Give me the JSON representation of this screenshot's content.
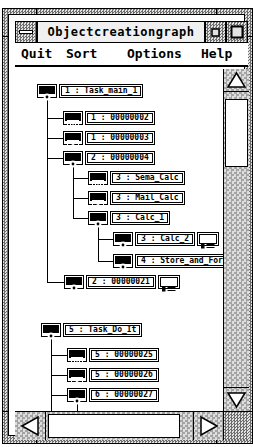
{
  "window": {
    "title": "Objectcreationgraph"
  },
  "menu": {
    "items": [
      {
        "label": "Quit"
      },
      {
        "label": "Sort"
      },
      {
        "label": "Options"
      },
      {
        "label": "Help"
      }
    ]
  },
  "tree1": {
    "nodes": [
      {
        "label": "1 : Task_main_1",
        "icon": "task"
      },
      {
        "label": "1 : 00000002",
        "icon": "semaphore"
      },
      {
        "label": "1 : 00000003",
        "icon": "mail"
      },
      {
        "label": "2 : 00000004",
        "icon": "task"
      },
      {
        "label": "3 : Sema_Calc",
        "icon": "semaphore"
      },
      {
        "label": "3 : Mail_Calc",
        "icon": "mail"
      },
      {
        "label": "3 : Calc_1",
        "icon": "task"
      },
      {
        "label": "3 : Calc_2",
        "icon": "task",
        "has_detail": true
      },
      {
        "label": "4 : Store_and_Forwa",
        "icon": "task"
      },
      {
        "label": "2 : 00000021",
        "icon": "task",
        "has_detail": true
      }
    ]
  },
  "tree2": {
    "nodes": [
      {
        "label": "5 : Task_Do_It",
        "icon": "task"
      },
      {
        "label": "5 : 00000025",
        "icon": "semaphore"
      },
      {
        "label": "5 : 00000026",
        "icon": "mail"
      },
      {
        "label": "6 : 00000027",
        "icon": "task"
      }
    ]
  },
  "icons": {
    "window_menu": "horizontal-bar",
    "minimize": "small-square",
    "maximize": "large-square",
    "task": "filled-circle",
    "semaphore": "barred-window",
    "mail": "envelope",
    "detail": "list-box",
    "scroll_up": "triangle-up",
    "scroll_down": "triangle-down",
    "scroll_left": "triangle-left",
    "scroll_right": "triangle-right"
  },
  "colors": {
    "ink": "#000000",
    "paper": "#ffffff",
    "frame_dither_dark": "#6e6e6e",
    "frame_dither_light": "#e2e2e2",
    "track_dither_dark": "#a4a4a4",
    "track_dither_light": "#dedede"
  }
}
